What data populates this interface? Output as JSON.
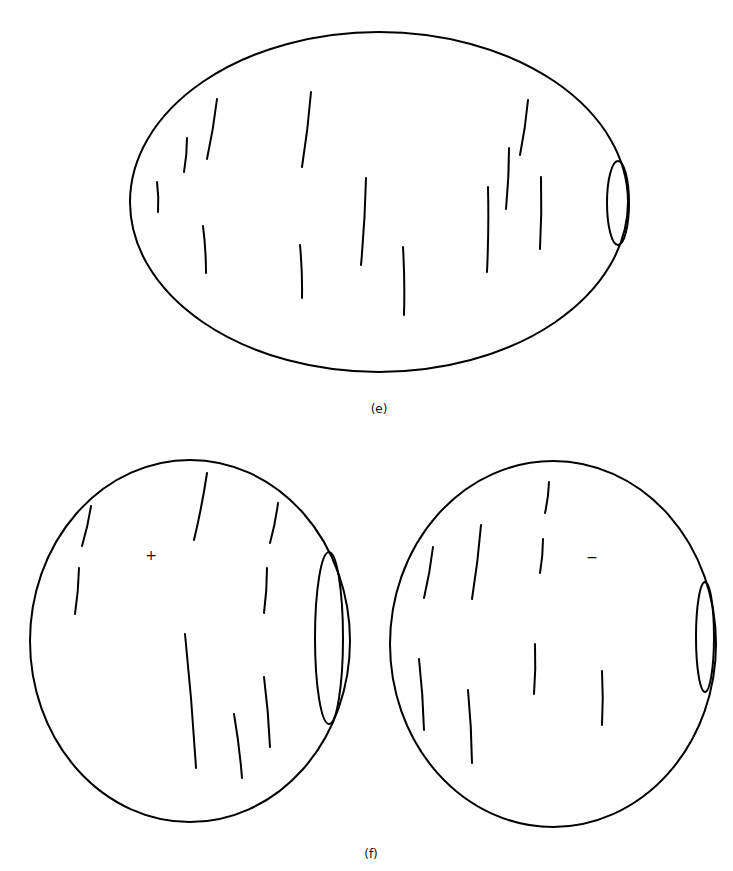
{
  "panels": {
    "e": {
      "label": "(e)",
      "outer": {
        "cx": 379,
        "cy": 202,
        "rx": 249,
        "ry": 170
      },
      "pole": {
        "cx": 618,
        "cy": 203,
        "rx": 11,
        "ry": 42
      },
      "strokes": [
        [
          217,
          99,
          207,
          159
        ],
        [
          187,
          138,
          184,
          172
        ],
        [
          157,
          182,
          158,
          212
        ],
        [
          203,
          226,
          206,
          273
        ],
        [
          311,
          92,
          302,
          167
        ],
        [
          300,
          245,
          302,
          298
        ],
        [
          366,
          178,
          361,
          265
        ],
        [
          403,
          247,
          404,
          315
        ],
        [
          528,
          100,
          520,
          155
        ],
        [
          509,
          148,
          506,
          209
        ],
        [
          488,
          187,
          487,
          272
        ],
        [
          541,
          177,
          540,
          249
        ]
      ]
    },
    "f": {
      "label": "(f)",
      "left": {
        "sign": "+",
        "outer": {
          "cx": 190,
          "cy": 641,
          "rx": 160,
          "ry": 181
        },
        "pole": {
          "cx": 329,
          "cy": 638,
          "rx": 14,
          "ry": 86
        },
        "strokes": [
          [
            91,
            506,
            82,
            546
          ],
          [
            79,
            568,
            75,
            614
          ],
          [
            207,
            473,
            194,
            540
          ],
          [
            278,
            503,
            270,
            543
          ],
          [
            267,
            568,
            264,
            613
          ],
          [
            185,
            634,
            196,
            768
          ],
          [
            234,
            714,
            242,
            778
          ],
          [
            264,
            677,
            270,
            747
          ]
        ]
      },
      "right": {
        "sign": "−",
        "outer": {
          "cx": 553,
          "cy": 644,
          "rx": 163,
          "ry": 183
        },
        "pole": {
          "cx": 705,
          "cy": 637,
          "rx": 9,
          "ry": 55
        },
        "strokes": [
          [
            549,
            482,
            545,
            513
          ],
          [
            543,
            539,
            540,
            573
          ],
          [
            433,
            547,
            424,
            598
          ],
          [
            481,
            525,
            472,
            599
          ],
          [
            419,
            659,
            424,
            730
          ],
          [
            468,
            690,
            472,
            763
          ],
          [
            535,
            644,
            534,
            694
          ],
          [
            602,
            671,
            602,
            725
          ]
        ]
      }
    }
  }
}
